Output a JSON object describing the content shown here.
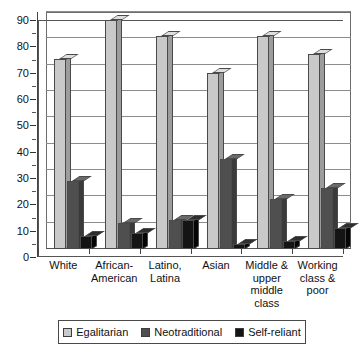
{
  "chart_data": {
    "type": "bar",
    "title": "",
    "xlabel": "",
    "ylabel": "",
    "ylim": [
      0,
      90
    ],
    "y_ticks": [
      0,
      10,
      20,
      30,
      40,
      50,
      60,
      70,
      80,
      90
    ],
    "y_minor_tick_step": 5,
    "grid": true,
    "legend_position": "bottom",
    "categories": [
      "White",
      "African-American",
      "Latino, Latina",
      "Asian",
      "Middle & upper middle class",
      "Working class & poor"
    ],
    "series": [
      {
        "name": "Egalitarian",
        "color": "#c9c9c9",
        "values": [
          72,
          87,
          81,
          67,
          81,
          74
        ]
      },
      {
        "name": "Neotraditional",
        "color": "#4f4f4f",
        "values": [
          26,
          10,
          11,
          34,
          19,
          23
        ]
      },
      {
        "name": "Self-reliant",
        "color": "#141414",
        "values": [
          5,
          6,
          11,
          2,
          3,
          8
        ]
      }
    ]
  },
  "axis": {
    "y_tick_labels": [
      "0",
      "10",
      "20",
      "30",
      "40",
      "50",
      "60",
      "70",
      "80",
      "90"
    ]
  },
  "x_labels": [
    {
      "lines": [
        "White"
      ]
    },
    {
      "lines": [
        "African-",
        "American"
      ]
    },
    {
      "lines": [
        "Latino,",
        "Latina"
      ]
    },
    {
      "lines": [
        "Asian"
      ]
    },
    {
      "lines": [
        "Middle &",
        "upper",
        "middle",
        "class"
      ]
    },
    {
      "lines": [
        "Working",
        "class &",
        "poor"
      ]
    }
  ],
  "legend": {
    "items": [
      {
        "label": "Egalitarian",
        "swatch": "egalitarian"
      },
      {
        "label": "Neotraditional",
        "swatch": "neotraditional"
      },
      {
        "label": "Self-reliant",
        "swatch": "selfreliant"
      }
    ]
  }
}
